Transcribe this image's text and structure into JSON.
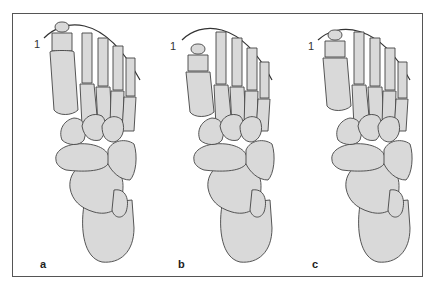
{
  "figure": {
    "panels": [
      {
        "id": "a",
        "label": "a",
        "arc_label": "1",
        "variant": "hallux-longest"
      },
      {
        "id": "b",
        "label": "b",
        "arc_label": "1",
        "variant": "second-toe-longest"
      },
      {
        "id": "c",
        "label": "c",
        "arc_label": "1",
        "variant": "equal-length"
      }
    ]
  },
  "colors": {
    "bone_fill": "#d9d9d9",
    "bone_stroke": "#444444",
    "arc": "#333333",
    "frame": "#555555"
  }
}
